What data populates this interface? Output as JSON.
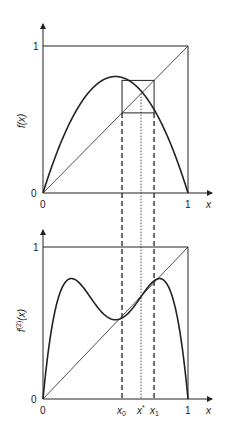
{
  "chart_data": [
    {
      "type": "line",
      "title": "",
      "xlabel": "x",
      "ylabel": "f(x)",
      "xlim": [
        0,
        1
      ],
      "ylim": [
        0,
        1
      ],
      "ticks": {
        "x": [
          "0",
          "1"
        ],
        "y": [
          "0",
          "1"
        ]
      },
      "series": [
        {
          "name": "f(x) = r x (1 - x), r ≈ 3.17",
          "style": "thick solid",
          "r": 3.17
        },
        {
          "name": "y = x",
          "style": "thin solid"
        }
      ],
      "annotations": [
        "period-2 cobweb box between x0 ≈ 0.545 and x1 ≈ 0.766",
        "dotted vertical at x* ≈ 0.68"
      ]
    },
    {
      "type": "line",
      "title": "",
      "xlabel": "x",
      "ylabel": "f(2)(x)",
      "xlim": [
        0,
        1
      ],
      "ylim": [
        0,
        1
      ],
      "ticks": {
        "x": [
          "0",
          "x0",
          "x*",
          "x1",
          "1"
        ],
        "y": [
          "0",
          "1"
        ]
      },
      "series": [
        {
          "name": "f(f(x))",
          "style": "thick solid",
          "r": 3.17
        },
        {
          "name": "y = x",
          "style": "thin solid"
        }
      ],
      "annotations": [
        "dashed verticals at x0 and x1",
        "dotted vertical at x*"
      ]
    }
  ],
  "top": {
    "ylabel": "f(x)",
    "tick_y0": "0",
    "tick_y1": "1",
    "tick_x0": "0",
    "tick_x1": "1",
    "xlabel": "x"
  },
  "bottom": {
    "ylabel_base": "f",
    "ylabel_sup": "(2)",
    "ylabel_arg": "(x)",
    "tick_y0": "0",
    "tick_y1": "1",
    "tick_x0": "0",
    "tick_x1": "1",
    "xlabel": "x",
    "x0_base": "x",
    "x0_sub": "0",
    "xstar_base": "x",
    "xstar_sup": "*",
    "x1_base": "x",
    "x1_sub": "1"
  },
  "params": {
    "r": 3.17,
    "x0": 0.545,
    "x1": 0.766,
    "xstar": 0.676,
    "color": "#222222"
  }
}
